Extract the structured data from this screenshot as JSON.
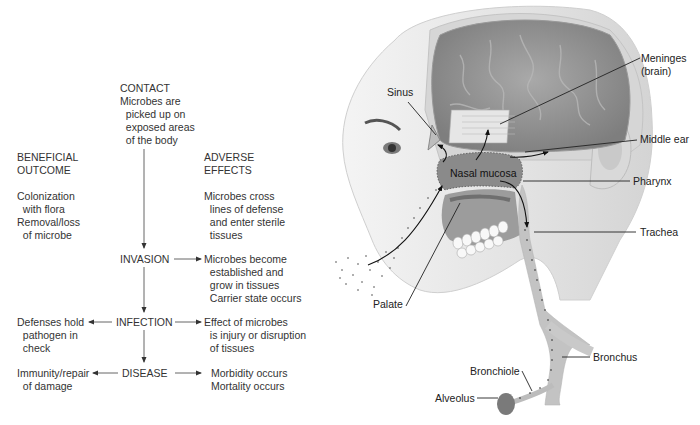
{
  "flowchart": {
    "contact": {
      "title": "CONTACT",
      "lines": [
        "Microbes are",
        "  picked up on",
        "  exposed areas",
        "  of the body"
      ]
    },
    "beneficial_header": [
      "BENEFICIAL",
      "OUTCOME"
    ],
    "beneficial_text": [
      "Colonization",
      "  with flora",
      "Removal/loss",
      "  of microbe"
    ],
    "adverse_header": [
      "ADVERSE",
      "EFFECTS"
    ],
    "adverse_text": [
      "Microbes cross",
      "  lines of defense",
      "  and enter sterile",
      "  tissues"
    ],
    "invasion": {
      "label": "INVASION",
      "result": [
        "Microbes become",
        "  established and",
        "  grow in tissues",
        "  Carrier state occurs"
      ]
    },
    "infection": {
      "label": "INFECTION",
      "left": [
        "Defenses hold",
        "  pathogen in",
        "  check"
      ],
      "right": [
        "Effect of microbes",
        "  is injury or disruption",
        "  of tissues"
      ]
    },
    "disease": {
      "label": "DISEASE",
      "left": [
        "Immunity/repair",
        "  of damage"
      ],
      "right": [
        "Morbidity occurs",
        "Mortality occurs"
      ]
    }
  },
  "anatomy": {
    "labels": {
      "meninges": "Meninges",
      "meninges_sub": "(brain)",
      "sinus": "Sinus",
      "middle_ear": "Middle ear",
      "nasal_mucosa": "Nasal mucosa",
      "pharynx": "Pharynx",
      "trachea": "Trachea",
      "palate": "Palate",
      "bronchus": "Bronchus",
      "bronchiole": "Bronchiole",
      "alveolus": "Alveolus"
    }
  }
}
